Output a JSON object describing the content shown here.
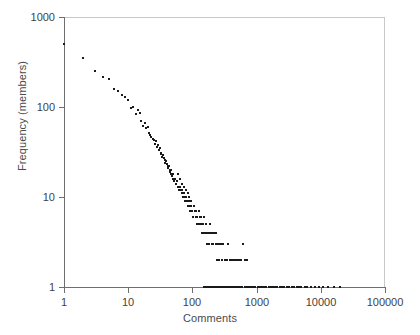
{
  "chart_data": {
    "type": "scatter",
    "title": "",
    "xlabel": "Comments",
    "ylabel": "Frequency (members)",
    "xscale": "log",
    "yscale": "log",
    "xlim": [
      1,
      100000
    ],
    "ylim": [
      1,
      1000
    ],
    "xticks": [
      1,
      10,
      100,
      1000,
      10000,
      100000
    ],
    "xtick_labels": [
      "1",
      "10",
      "100",
      "1000",
      "10000",
      "100000"
    ],
    "yticks": [
      1,
      10,
      100,
      1000
    ],
    "ytick_labels": [
      "1",
      "10",
      "100",
      "1000"
    ],
    "grid": false,
    "legend": null,
    "marker": "small-black-dot",
    "marker_color": "#1a1a1a",
    "points": [
      [
        1,
        500
      ],
      [
        2,
        350
      ],
      [
        3,
        250
      ],
      [
        4,
        215
      ],
      [
        5,
        205
      ],
      [
        6,
        160
      ],
      [
        7,
        150
      ],
      [
        8,
        135
      ],
      [
        9,
        130
      ],
      [
        10,
        120
      ],
      [
        11,
        97
      ],
      [
        12,
        100
      ],
      [
        13,
        83
      ],
      [
        14,
        93
      ],
      [
        15,
        86
      ],
      [
        16,
        70
      ],
      [
        17,
        62
      ],
      [
        18,
        66
      ],
      [
        19,
        58
      ],
      [
        20,
        60
      ],
      [
        21,
        52
      ],
      [
        22,
        49
      ],
      [
        23,
        46
      ],
      [
        24,
        44
      ],
      [
        25,
        43
      ],
      [
        26,
        39
      ],
      [
        27,
        42
      ],
      [
        28,
        36
      ],
      [
        29,
        38
      ],
      [
        30,
        33
      ],
      [
        31,
        35
      ],
      [
        32,
        30
      ],
      [
        33,
        31
      ],
      [
        34,
        28
      ],
      [
        35,
        29
      ],
      [
        36,
        27
      ],
      [
        37,
        26
      ],
      [
        38,
        24
      ],
      [
        39,
        25
      ],
      [
        40,
        23
      ],
      [
        41,
        22
      ],
      [
        42,
        21
      ],
      [
        43,
        22
      ],
      [
        44,
        20
      ],
      [
        45,
        19
      ],
      [
        46,
        20
      ],
      [
        47,
        18
      ],
      [
        48,
        17
      ],
      [
        49,
        18
      ],
      [
        50,
        16
      ],
      [
        52,
        15
      ],
      [
        54,
        16
      ],
      [
        56,
        14
      ],
      [
        58,
        15
      ],
      [
        60,
        13
      ],
      [
        62,
        12
      ],
      [
        64,
        13
      ],
      [
        66,
        12
      ],
      [
        68,
        11
      ],
      [
        70,
        12
      ],
      [
        72,
        10
      ],
      [
        74,
        11
      ],
      [
        76,
        10
      ],
      [
        78,
        9
      ],
      [
        80,
        10
      ],
      [
        82,
        9
      ],
      [
        85,
        8
      ],
      [
        88,
        9
      ],
      [
        90,
        8
      ],
      [
        93,
        7
      ],
      [
        96,
        8
      ],
      [
        100,
        7
      ],
      [
        104,
        6
      ],
      [
        108,
        7
      ],
      [
        112,
        6
      ],
      [
        116,
        5
      ],
      [
        120,
        6
      ],
      [
        125,
        5
      ],
      [
        130,
        6
      ],
      [
        135,
        5
      ],
      [
        140,
        4
      ],
      [
        145,
        5
      ],
      [
        150,
        4
      ],
      [
        155,
        4
      ],
      [
        160,
        5
      ],
      [
        165,
        4
      ],
      [
        170,
        3
      ],
      [
        175,
        4
      ],
      [
        180,
        3
      ],
      [
        190,
        4
      ],
      [
        200,
        3
      ],
      [
        210,
        3
      ],
      [
        220,
        4
      ],
      [
        230,
        3
      ],
      [
        240,
        2
      ],
      [
        250,
        3
      ],
      [
        260,
        2
      ],
      [
        275,
        3
      ],
      [
        290,
        2
      ],
      [
        300,
        3
      ],
      [
        320,
        2
      ],
      [
        340,
        2
      ],
      [
        360,
        3
      ],
      [
        380,
        2
      ],
      [
        400,
        2
      ],
      [
        430,
        2
      ],
      [
        460,
        2
      ],
      [
        500,
        2
      ],
      [
        540,
        2
      ],
      [
        580,
        2
      ],
      [
        620,
        3
      ],
      [
        660,
        2
      ],
      [
        700,
        2
      ],
      [
        60,
        18
      ],
      [
        65,
        16
      ],
      [
        70,
        14
      ],
      [
        75,
        13
      ],
      [
        80,
        12
      ],
      [
        85,
        11
      ],
      [
        90,
        10
      ],
      [
        95,
        9
      ],
      [
        105,
        8
      ],
      [
        115,
        7
      ],
      [
        125,
        7
      ],
      [
        135,
        6
      ],
      [
        150,
        6
      ],
      [
        165,
        5
      ],
      [
        185,
        5
      ],
      [
        205,
        4
      ],
      [
        230,
        4
      ],
      [
        260,
        3
      ],
      [
        300,
        3
      ],
      [
        150,
        1
      ],
      [
        160,
        1
      ],
      [
        170,
        1
      ],
      [
        180,
        1
      ],
      [
        190,
        1
      ],
      [
        200,
        1
      ],
      [
        215,
        1
      ],
      [
        230,
        1
      ],
      [
        245,
        1
      ],
      [
        260,
        1
      ],
      [
        280,
        1
      ],
      [
        300,
        1
      ],
      [
        320,
        1
      ],
      [
        340,
        1
      ],
      [
        365,
        1
      ],
      [
        390,
        1
      ],
      [
        420,
        1
      ],
      [
        450,
        1
      ],
      [
        480,
        1
      ],
      [
        520,
        1
      ],
      [
        560,
        1
      ],
      [
        600,
        1
      ],
      [
        650,
        1
      ],
      [
        700,
        1
      ],
      [
        760,
        1
      ],
      [
        820,
        1
      ],
      [
        890,
        1
      ],
      [
        960,
        1
      ],
      [
        1040,
        1
      ],
      [
        1120,
        1
      ],
      [
        1210,
        1
      ],
      [
        1310,
        1
      ],
      [
        1420,
        1
      ],
      [
        1540,
        1
      ],
      [
        1670,
        1
      ],
      [
        1800,
        1
      ],
      [
        1950,
        1
      ],
      [
        2100,
        1
      ],
      [
        2300,
        1
      ],
      [
        2500,
        1
      ],
      [
        2700,
        1
      ],
      [
        2950,
        1
      ],
      [
        3200,
        1
      ],
      [
        3500,
        1
      ],
      [
        3800,
        1
      ],
      [
        4200,
        1
      ],
      [
        4600,
        1
      ],
      [
        5000,
        1
      ],
      [
        5600,
        1
      ],
      [
        6200,
        1
      ],
      [
        7000,
        1
      ],
      [
        8000,
        1
      ],
      [
        9500,
        1
      ],
      [
        11000,
        1
      ],
      [
        13000,
        1
      ],
      [
        16000,
        1
      ],
      [
        20000,
        1
      ]
    ]
  },
  "axes": {
    "x_label": "Comments",
    "y_label": "Frequency (members)",
    "x_tick_labels": [
      "1",
      "10",
      "100",
      "1000",
      "10000",
      "100000"
    ],
    "y_tick_labels": [
      "1000",
      "100",
      "10",
      "1"
    ]
  }
}
